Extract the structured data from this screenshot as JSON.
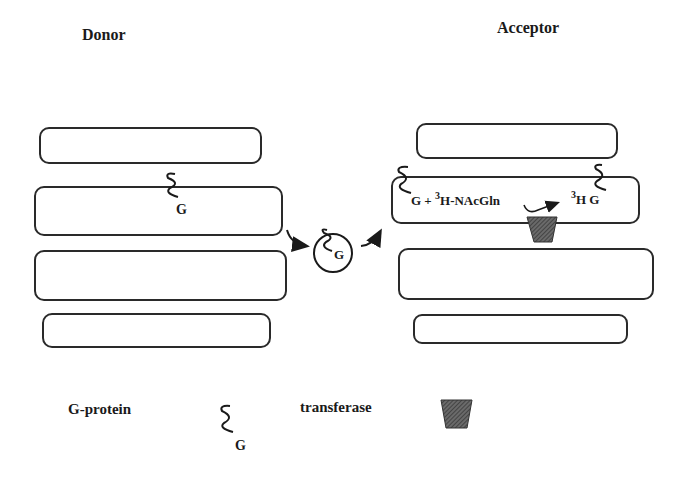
{
  "titles": {
    "donor": "Donor",
    "acceptor": "Acceptor"
  },
  "labels": {
    "g": "G",
    "reaction_left": "G + ",
    "sup3": "3",
    "reagent": "H-NAcGln",
    "product_h": "H G"
  },
  "legend": {
    "gprotein_label": "G-protein",
    "gprotein_symbol": "G",
    "transferase_label": "transferase"
  },
  "colors": {
    "stroke": "#2a2a2a",
    "transferase_fill": "#555555"
  }
}
